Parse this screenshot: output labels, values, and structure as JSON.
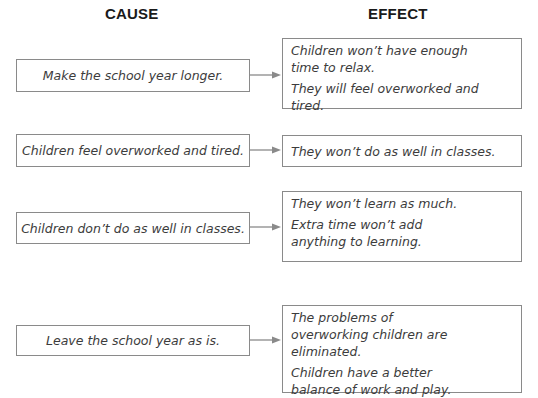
{
  "headings": {
    "cause": "CAUSE",
    "effect": "EFFECT"
  },
  "rows": [
    {
      "cause": "Make the school year longer.",
      "effects": [
        "Children won’t have enough time to relax.",
        "They will feel overworked and tired."
      ]
    },
    {
      "cause": "Children feel overworked and tired.",
      "effects": [
        "They won’t do as well in classes."
      ]
    },
    {
      "cause": "Children don’t do as well in classes.",
      "effects": [
        "They won’t learn as much.",
        "Extra time won’t add anything to learning."
      ]
    },
    {
      "cause": "Leave the school year as is.",
      "effects": [
        "The problems of overworking children are eliminated.",
        "Children have a better balance of work and play."
      ]
    }
  ],
  "colors": {
    "border": "#8a8a8a",
    "text": "#3c3c3c",
    "heading": "#1a1a1a",
    "arrow": "#8a8a8a"
  }
}
